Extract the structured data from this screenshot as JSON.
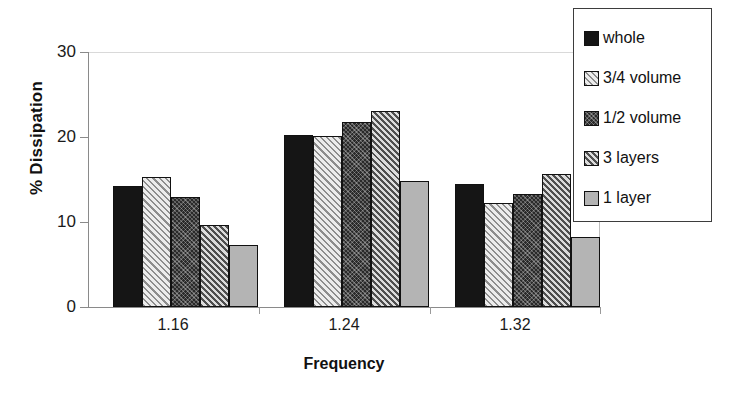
{
  "chart_data": {
    "type": "bar",
    "title": "",
    "xlabel": "Frequency",
    "ylabel": "% Dissipation",
    "categories": [
      "1.16",
      "1.24",
      "1.32"
    ],
    "ylim": [
      0,
      30
    ],
    "yticks": [
      0,
      10,
      20,
      30
    ],
    "grid": false,
    "legend_position": "top-right",
    "series": [
      {
        "name": "whole",
        "pattern": "solid-black",
        "color": "#151515",
        "values": [
          14.2,
          20.2,
          14.5
        ]
      },
      {
        "name": "3/4 volume",
        "pattern": "light-diagonal",
        "color": "#e9e9e9",
        "values": [
          15.3,
          20.1,
          12.2
        ]
      },
      {
        "name": "1/2 volume",
        "pattern": "dark-crosshatch",
        "color": "#2a2a2a",
        "values": [
          12.9,
          21.8,
          13.3
        ]
      },
      {
        "name": "3 layers",
        "pattern": "gray-diagonal",
        "color": "#d7d7d7",
        "values": [
          9.7,
          23.1,
          15.7
        ]
      },
      {
        "name": "1 layer",
        "pattern": "solid-gray",
        "color": "#b4b4b4",
        "values": [
          7.3,
          14.8,
          8.3
        ]
      }
    ]
  },
  "axes": {
    "y_tick_labels": [
      "30",
      "20",
      "10",
      "0"
    ],
    "y_title": "% Dissipation",
    "x_title": "Frequency",
    "x_tick_labels": [
      "1.16",
      "1.24",
      "1.32"
    ]
  },
  "legend": {
    "items": [
      {
        "label": "whole"
      },
      {
        "label": "3/4 volume"
      },
      {
        "label": "1/2 volume"
      },
      {
        "label": "3 layers"
      },
      {
        "label": "1 layer"
      }
    ]
  }
}
